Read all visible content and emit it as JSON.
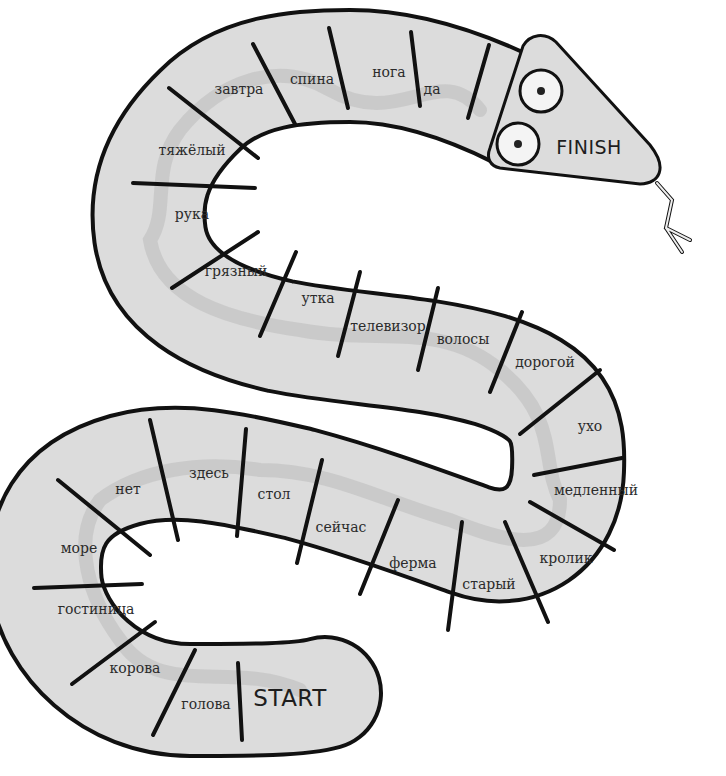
{
  "game": {
    "type": "snake board game",
    "start_label": "START",
    "finish_label": "FINISH",
    "colors": {
      "board_fill": "#dcdcdc",
      "outline": "#111111",
      "ribbon": "#c6c6c6",
      "background": "#ffffff"
    },
    "cells": [
      {
        "index": 1,
        "word": "голова"
      },
      {
        "index": 2,
        "word": "корова"
      },
      {
        "index": 3,
        "word": "гостиница"
      },
      {
        "index": 4,
        "word": "море"
      },
      {
        "index": 5,
        "word": "нет"
      },
      {
        "index": 6,
        "word": "здесь"
      },
      {
        "index": 7,
        "word": "стол"
      },
      {
        "index": 8,
        "word": "сейчас"
      },
      {
        "index": 9,
        "word": "ферма"
      },
      {
        "index": 10,
        "word": "старый"
      },
      {
        "index": 11,
        "word": "кролик"
      },
      {
        "index": 12,
        "word": "медленный"
      },
      {
        "index": 13,
        "word": "ухо"
      },
      {
        "index": 14,
        "word": "дорогой"
      },
      {
        "index": 15,
        "word": "волосы"
      },
      {
        "index": 16,
        "word": "телевизор"
      },
      {
        "index": 17,
        "word": "утка"
      },
      {
        "index": 18,
        "word": "грязный"
      },
      {
        "index": 19,
        "word": "рука"
      },
      {
        "index": 20,
        "word": "тяжёлый"
      },
      {
        "index": 21,
        "word": "завтра"
      },
      {
        "index": 22,
        "word": "спина"
      },
      {
        "index": 23,
        "word": "нога"
      },
      {
        "index": 24,
        "word": "да"
      }
    ]
  }
}
